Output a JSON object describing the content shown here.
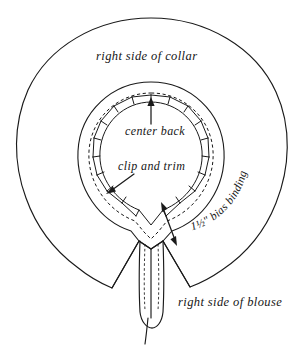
{
  "figure": {
    "background_color": "#ffffff",
    "ink_color": "#1a1a1a"
  },
  "labels": {
    "collar": "right side of collar",
    "blouse": "right side of blouse",
    "center_back": "center back",
    "clip_and_trim": "clip and trim",
    "bias_binding": "1½\" bias binding"
  },
  "annotations": [
    {
      "name": "center-back-arrow",
      "points_to": "center back neckline seam",
      "direction": "up"
    },
    {
      "name": "clip-and-trim-arrow",
      "points_to": "clipped notch on neckline",
      "direction": "down-left"
    },
    {
      "name": "bias-binding-width-arrow",
      "points_to": "binding width",
      "direction": "double-headed"
    }
  ],
  "elements": {
    "outer_collar": "right side of collar outer edge",
    "collar_inner_ring": "collar inner ring",
    "neckline_notches": "clipped and trimmed neckline seam allowance",
    "binding_stitch_line": "dashed bias binding stitch line",
    "binding_tail": "bias binding tail hanging at center front",
    "blouse_v_left": "left blouse opening",
    "blouse_v_right": "right blouse opening"
  }
}
